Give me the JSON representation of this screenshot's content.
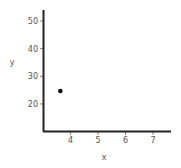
{
  "chart_data": {
    "type": "scatter",
    "title": "",
    "xlabel": "x",
    "ylabel": "y",
    "x": [
      3.63
    ],
    "y": [
      24.7
    ],
    "xlim": [
      3.0,
      7.65
    ],
    "ylim": [
      10.2,
      54
    ],
    "xticks": [
      4,
      5,
      6,
      7
    ],
    "yticks": [
      20,
      30,
      40,
      50
    ],
    "xtick_labels": [
      "4",
      "5",
      "6",
      "7"
    ],
    "ytick_labels": [
      "20",
      "30",
      "40",
      "50"
    ],
    "grid": false,
    "legend": null,
    "axes_visible": [
      "left",
      "bottom"
    ]
  },
  "colors": {
    "axis": "#222222",
    "point": "#111111",
    "text": "#555555"
  }
}
